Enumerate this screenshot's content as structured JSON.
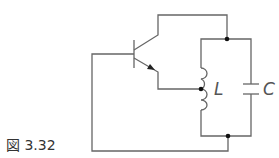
{
  "figure": {
    "caption": "図 3.32"
  },
  "components": {
    "inductor_label": "L",
    "capacitor_label": "C",
    "transistor": "npn-bjt"
  },
  "colors": {
    "wire": "#666666",
    "node": "#111111",
    "background": "#ffffff"
  }
}
